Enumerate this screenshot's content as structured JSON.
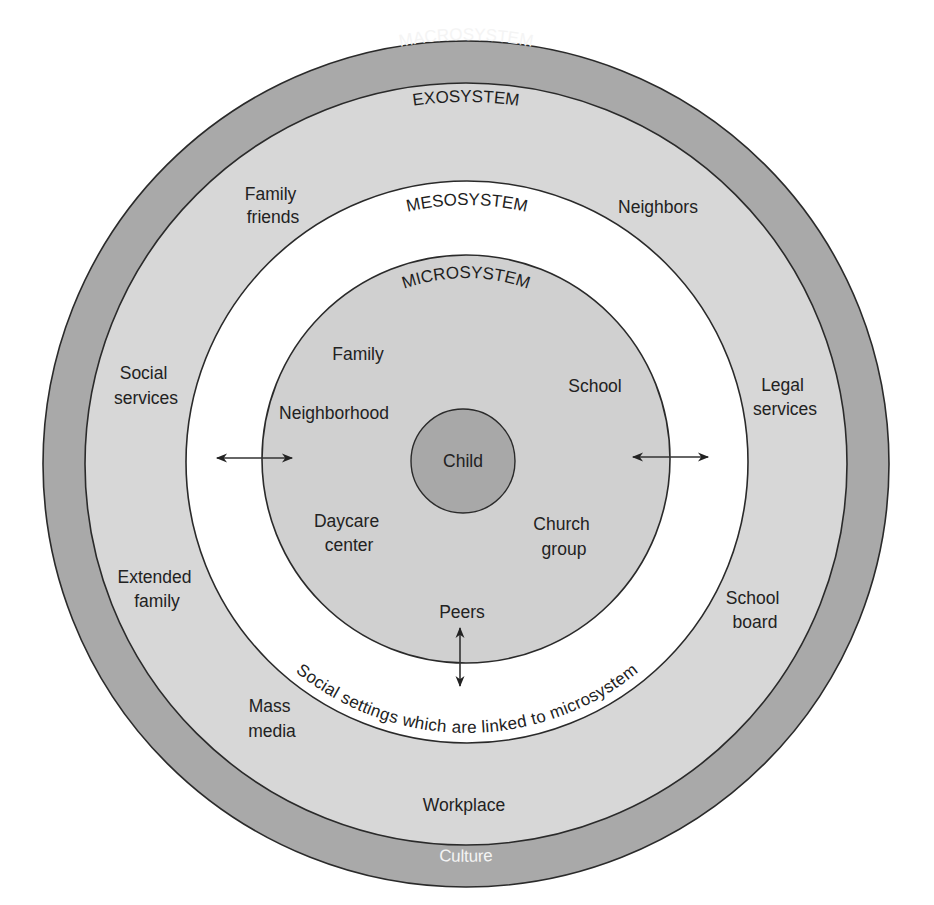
{
  "diagram": {
    "type": "concentric-circles",
    "colors": {
      "background": "#ffffff",
      "macro_fill": "#a9a9a9",
      "exo_fill": "#d7d7d7",
      "meso_fill": "#ffffff",
      "micro_fill": "#d0d0d0",
      "child_fill": "#a8a8a8",
      "stroke": "#2a2a2a",
      "text": "#222222",
      "macro_text": "#f4f4f4"
    },
    "rings": {
      "macrosystem": {
        "title": "MACROSYSTEM",
        "bottom_label": "Culture"
      },
      "exosystem": {
        "title": "EXOSYSTEM",
        "items": {
          "family_friends": [
            "Family",
            "friends"
          ],
          "neighbors": "Neighbors",
          "social_services": [
            "Social",
            "services"
          ],
          "legal_services": [
            "Legal",
            "services"
          ],
          "extended_family": [
            "Extended",
            "family"
          ],
          "school_board": [
            "School",
            "board"
          ],
          "mass_media": [
            "Mass",
            "media"
          ],
          "workplace": "Workplace"
        }
      },
      "mesosystem": {
        "title": "MESOSYSTEM",
        "caption": "Social settings which are linked to microsystem"
      },
      "microsystem": {
        "title": "MICROSYSTEM",
        "items": {
          "family": "Family",
          "school": "School",
          "neighborhood": "Neighborhood",
          "daycare_center": [
            "Daycare",
            "center"
          ],
          "church_group": [
            "Church",
            "group"
          ],
          "peers": "Peers"
        }
      },
      "center": {
        "label": "Child"
      }
    },
    "arrows": [
      {
        "name": "left-bidirectional-arrow",
        "direction": "horizontal"
      },
      {
        "name": "right-bidirectional-arrow",
        "direction": "horizontal"
      },
      {
        "name": "bottom-bidirectional-arrow",
        "direction": "vertical"
      }
    ]
  }
}
